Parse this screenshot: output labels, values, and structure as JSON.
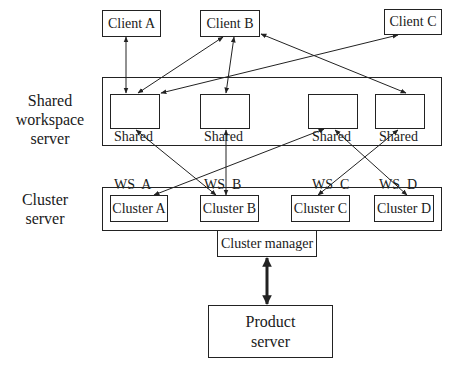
{
  "colors": {
    "stroke": "#222222",
    "background": "#ffffff",
    "text": "#1a1a1a"
  },
  "side_labels": {
    "shared_workspace": [
      "Shared",
      "workspace",
      "server"
    ],
    "cluster": [
      "Cluster",
      "server"
    ]
  },
  "clients": [
    {
      "id": "client-a",
      "label": "Client A"
    },
    {
      "id": "client-b",
      "label": "Client B"
    },
    {
      "id": "client-c",
      "label": "Client C"
    }
  ],
  "shared_workspaces": [
    {
      "id": "ws-a",
      "line1": "Shared",
      "line2": "WS  A"
    },
    {
      "id": "ws-b",
      "line1": "Shared",
      "line2": "WS  B"
    },
    {
      "id": "ws-c",
      "line1": "Shared",
      "line2": "WS  C"
    },
    {
      "id": "ws-d",
      "line1": "Shared",
      "line2": "WS  D"
    }
  ],
  "clusters": [
    {
      "id": "cluster-a",
      "label": "Cluster A"
    },
    {
      "id": "cluster-b",
      "label": "Cluster B"
    },
    {
      "id": "cluster-c",
      "label": "Cluster C"
    },
    {
      "id": "cluster-d",
      "label": "Cluster D"
    }
  ],
  "cluster_manager": {
    "label": "Cluster manager"
  },
  "product_server": {
    "line1": "Product",
    "line2": "server"
  },
  "connections": [
    {
      "from": "client-a",
      "to": "ws-a",
      "bidirectional": true
    },
    {
      "from": "client-b",
      "to": "ws-a",
      "bidirectional": true
    },
    {
      "from": "client-b",
      "to": "ws-b",
      "bidirectional": true
    },
    {
      "from": "client-b",
      "to": "ws-d",
      "bidirectional": true
    },
    {
      "from": "client-c",
      "to": "ws-a",
      "bidirectional": true
    },
    {
      "from": "ws-a",
      "to": "cluster-b",
      "bidirectional": true
    },
    {
      "from": "ws-b",
      "to": "cluster-b",
      "bidirectional": true
    },
    {
      "from": "ws-c",
      "to": "cluster-a",
      "bidirectional": true
    },
    {
      "from": "ws-c",
      "to": "cluster-d",
      "bidirectional": true
    },
    {
      "from": "ws-d",
      "to": "cluster-c",
      "bidirectional": true
    },
    {
      "from": "cluster-manager",
      "to": "product-server",
      "bidirectional": true,
      "thick": true
    }
  ]
}
